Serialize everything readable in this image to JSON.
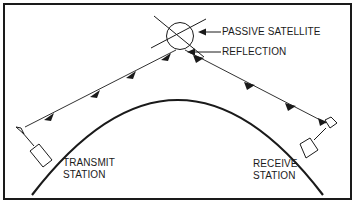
{
  "diagram": {
    "labels": {
      "satellite": "PASSIVE SATELLITE",
      "reflection": "REFLECTION",
      "transmit_line1": "TRANSMIT",
      "transmit_line2": "STATION",
      "receive_line1": "RECEIVE",
      "receive_line2": "STATION"
    },
    "nodes": [
      {
        "id": "transmit-station",
        "label": "TRANSMIT STATION"
      },
      {
        "id": "passive-satellite",
        "label": "PASSIVE SATELLITE"
      },
      {
        "id": "receive-station",
        "label": "RECEIVE STATION"
      }
    ],
    "edges": [
      {
        "from": "transmit-station",
        "to": "passive-satellite",
        "arrows": 3
      },
      {
        "from": "passive-satellite",
        "to": "receive-station",
        "arrows": 4
      }
    ],
    "colors": {
      "ink": "#1a1a1a",
      "background": "#ffffff"
    }
  }
}
